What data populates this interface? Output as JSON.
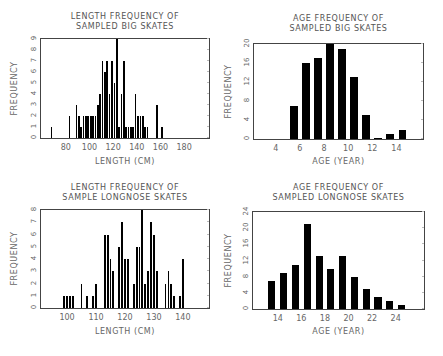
{
  "chart_data": [
    {
      "id": "big-length",
      "type": "bar",
      "title": "LENGTH FREQUENCY OF\nSAMPLED BIG SKATES",
      "xlabel": "LENGTH (CM)",
      "ylabel": "FREQUENCY",
      "xlim": [
        59,
        201
      ],
      "ylim": [
        0,
        9
      ],
      "xticks": [
        80,
        100,
        120,
        140,
        160,
        180
      ],
      "yticks": [
        0,
        1,
        2,
        3,
        4,
        5,
        6,
        7,
        8,
        9
      ],
      "bar_width": 1.4,
      "x": [
        68,
        70,
        72,
        74,
        76,
        78,
        83,
        85,
        89,
        91,
        93,
        95,
        97,
        99,
        101,
        103,
        105,
        107,
        109,
        111,
        113,
        115,
        117,
        119,
        121,
        123,
        125,
        127,
        129,
        131,
        133,
        135,
        137,
        139,
        141,
        143,
        145,
        147,
        149,
        151,
        153,
        155,
        157,
        159,
        161,
        163,
        165,
        167,
        169,
        171,
        173,
        175,
        177,
        179,
        181
      ],
      "values": [
        1,
        0,
        0,
        0,
        0,
        0,
        2,
        0,
        3,
        2,
        1,
        2,
        2,
        2,
        2,
        2,
        2,
        3,
        4,
        7,
        6,
        7,
        4,
        7,
        5,
        9,
        1,
        4,
        7,
        1,
        1,
        1,
        1,
        4,
        2,
        2,
        2,
        1,
        1,
        0,
        0,
        0,
        3,
        0,
        1,
        0,
        0,
        0,
        0,
        0,
        0,
        0,
        0,
        0,
        0
      ]
    },
    {
      "id": "big-age",
      "type": "bar",
      "title": "AGE FREQUENCY OF\nSAMPLED BIG SKATES",
      "xlabel": "AGE (YEAR)",
      "ylabel": "FREQUENCY",
      "xlim": [
        2.2,
        16.2
      ],
      "ylim": [
        0,
        20
      ],
      "xticks": [
        4,
        6,
        8,
        10,
        12,
        14
      ],
      "yticks": [
        0,
        4,
        8,
        12,
        16,
        20
      ],
      "bar_width": 0.65,
      "x": [
        4.5,
        5.5,
        6.5,
        7.5,
        8.5,
        9.5,
        10.5,
        11.5,
        12.5,
        13.5,
        14.5
      ],
      "values": [
        0,
        7,
        16,
        17,
        20,
        19,
        13,
        5,
        0.2,
        1,
        2
      ]
    },
    {
      "id": "longnose-length",
      "type": "bar",
      "title": "LENGTH FREQUENCY OF\nSAMPLE LONGNOSE SKATES",
      "xlabel": "LENGTH (CM)",
      "ylabel": "FREQUENCY",
      "xlim": [
        91,
        149
      ],
      "ylim": [
        0,
        8
      ],
      "xticks": [
        100,
        110,
        120,
        130,
        140
      ],
      "yticks": [
        0,
        1,
        2,
        3,
        4,
        5,
        6,
        7,
        8
      ],
      "bar_width": 0.65,
      "x": [
        99,
        100,
        101,
        102,
        105,
        107,
        109,
        110,
        113,
        114,
        115,
        116,
        118,
        119,
        120,
        121,
        123,
        124,
        125,
        126,
        127,
        128,
        129,
        130,
        131,
        132,
        134,
        135,
        136,
        137,
        139,
        140
      ],
      "values": [
        1,
        1,
        1,
        1,
        2,
        1,
        1,
        2,
        6,
        6,
        4,
        3,
        5,
        7,
        4,
        4,
        2,
        5,
        5,
        8,
        2,
        3,
        7,
        6,
        3,
        0,
        2,
        3,
        2,
        1,
        1,
        4
      ]
    },
    {
      "id": "longnose-age",
      "type": "bar",
      "title": "AGE FREQUENCY OF\nSAMPLED LONGNOSE SKATES",
      "xlabel": "AGE (YEAR)",
      "ylabel": "FREQUENCY",
      "xlim": [
        11.9,
        26.4
      ],
      "ylim": [
        0,
        24
      ],
      "xticks": [
        14,
        16,
        18,
        20,
        22,
        24
      ],
      "yticks": [
        0,
        4,
        8,
        12,
        16,
        20,
        24
      ],
      "bar_width": 0.6,
      "x": [
        13.5,
        14.5,
        15.5,
        16.5,
        17.5,
        18.5,
        19.5,
        20.5,
        21.5,
        22.5,
        23.5,
        24.5
      ],
      "values": [
        7,
        9,
        11,
        21,
        13,
        10,
        13,
        8,
        5,
        3,
        2,
        1
      ]
    }
  ],
  "layout": [
    {
      "title_x": 40,
      "title_y": 12,
      "title_w": 170,
      "plot": {
        "x": 40,
        "y": 38,
        "w": 170,
        "h": 101
      },
      "ylabel_x": 8,
      "xlabel_y": 157
    },
    {
      "title_x": 253,
      "title_y": 14,
      "title_w": 171,
      "plot": {
        "x": 253,
        "y": 43,
        "w": 171,
        "h": 97
      },
      "ylabel_x": 222,
      "xlabel_y": 157
    },
    {
      "title_x": 40,
      "title_y": 183,
      "title_w": 170,
      "plot": {
        "x": 40,
        "y": 209,
        "w": 170,
        "h": 100
      },
      "ylabel_x": 8,
      "xlabel_y": 327
    },
    {
      "title_x": 252,
      "title_y": 183,
      "title_w": 173,
      "plot": {
        "x": 252,
        "y": 211,
        "w": 173,
        "h": 99
      },
      "ylabel_x": 222,
      "xlabel_y": 327
    }
  ]
}
